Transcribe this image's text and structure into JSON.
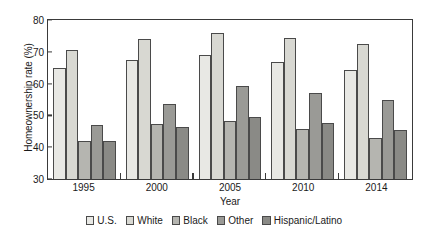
{
  "chart_data": {
    "type": "bar",
    "title": "",
    "xlabel": "Year",
    "ylabel": "Homeownership rate (%)",
    "categories": [
      "1995",
      "2000",
      "2005",
      "2010",
      "2014"
    ],
    "ylim": [
      30,
      80
    ],
    "yticks": [
      30,
      40,
      50,
      60,
      70,
      80
    ],
    "ytick_labels": [
      "30",
      "40",
      "50",
      "60",
      "70",
      "80"
    ],
    "grid": false,
    "legend_position": "bottom",
    "series": [
      {
        "name": "U.S.",
        "color": "#e8e8e4",
        "values": [
          65.0,
          67.5,
          69.0,
          66.9,
          64.4
        ]
      },
      {
        "name": "White",
        "color": "#d8d8d2",
        "values": [
          70.5,
          73.9,
          76.0,
          74.4,
          72.5
        ]
      },
      {
        "name": "Black",
        "color": "#b5b5b0",
        "values": [
          42.0,
          47.3,
          48.1,
          45.6,
          42.9
        ]
      },
      {
        "name": "Other",
        "color": "#9a9a96",
        "values": [
          47.0,
          53.5,
          59.4,
          56.9,
          54.9
        ]
      },
      {
        "name": "Hispanic/Latino",
        "color": "#8a8a86",
        "values": [
          42.0,
          46.4,
          49.6,
          47.5,
          45.4
        ]
      }
    ]
  }
}
